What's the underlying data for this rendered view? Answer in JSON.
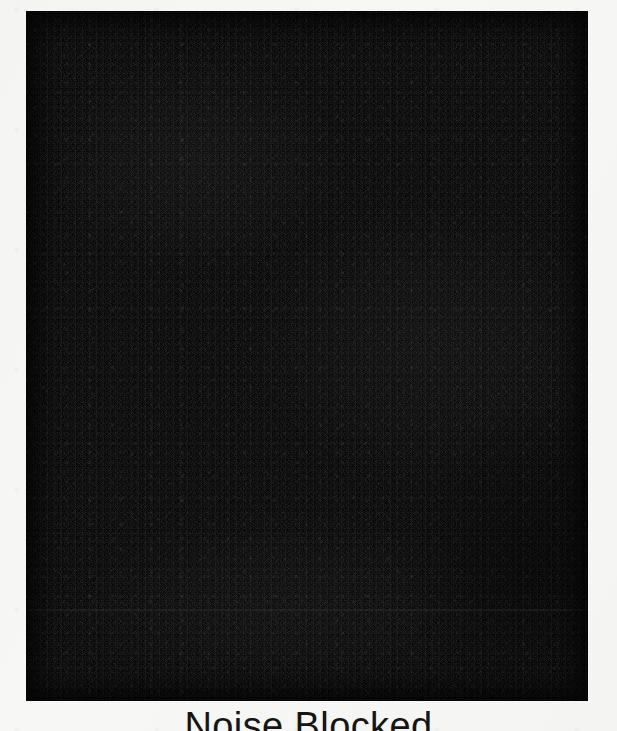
{
  "figure": {
    "caption": "Noise Blocked",
    "plate": {
      "label": "noise-field",
      "fill_color": "#080808",
      "left": 26,
      "top": 11,
      "width": 562,
      "height": 690
    },
    "page_background_color": "#f7f7f5",
    "caption_color": "#151515"
  }
}
